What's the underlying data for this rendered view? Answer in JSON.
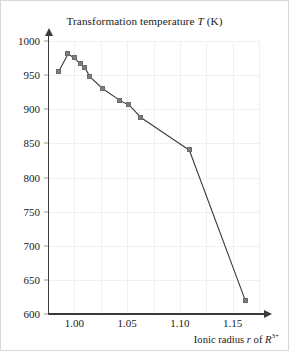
{
  "figure": {
    "background": "#ffffff",
    "border_color": "#d8d8d8"
  },
  "chart_data": {
    "type": "line",
    "title": "Transformation temperature T (K)",
    "title_plain": "Transformation temperature",
    "title_symbol": "T",
    "title_unit": "(K)",
    "xlabel": "Ionic radius r of R3+",
    "xlabel_plain_prefix": "Ionic radius ",
    "xlabel_symbol_r": "r",
    "xlabel_plain_mid": " of ",
    "xlabel_symbol_R": "R",
    "xlabel_superscript": "3+",
    "ylabel": "Transformation temperature T (K)",
    "xlim": [
      0.975,
      1.175
    ],
    "ylim": [
      600,
      1000
    ],
    "xticks": [
      "1.00",
      "1.05",
      "1.10",
      "1.15"
    ],
    "xtick_values": [
      1.0,
      1.05,
      1.1,
      1.15
    ],
    "yticks": [
      "600",
      "650",
      "700",
      "750",
      "800",
      "850",
      "900",
      "950",
      "1000"
    ],
    "ytick_values": [
      600,
      650,
      700,
      750,
      800,
      850,
      900,
      950,
      1000
    ],
    "grid": true,
    "grid_color": "#f0f0f0",
    "legend": null,
    "line_color": "#3a3a3a",
    "marker_color": "#7d7d7d",
    "marker_shape": "square",
    "x": [
      0.985,
      0.994,
      1.0,
      1.006,
      1.01,
      1.015,
      1.027,
      1.043,
      1.052,
      1.063,
      1.109,
      1.162
    ],
    "y": [
      955,
      981,
      975,
      966,
      961,
      947,
      930,
      913,
      906,
      888,
      840,
      620
    ],
    "points": [
      {
        "x": 0.985,
        "y": 955
      },
      {
        "x": 0.994,
        "y": 981
      },
      {
        "x": 1.0,
        "y": 975
      },
      {
        "x": 1.006,
        "y": 966
      },
      {
        "x": 1.01,
        "y": 961
      },
      {
        "x": 1.015,
        "y": 947
      },
      {
        "x": 1.027,
        "y": 930
      },
      {
        "x": 1.043,
        "y": 913
      },
      {
        "x": 1.052,
        "y": 906
      },
      {
        "x": 1.063,
        "y": 888
      },
      {
        "x": 1.109,
        "y": 840
      },
      {
        "x": 1.162,
        "y": 620
      }
    ]
  }
}
